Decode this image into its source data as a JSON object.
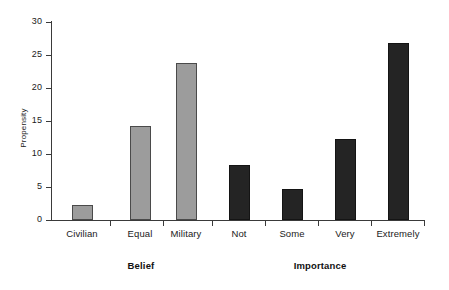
{
  "chart_data": {
    "type": "bar",
    "title": "",
    "subtitle": "",
    "xlabel": "",
    "ylabel": "Propensity",
    "ylim": [
      0,
      30
    ],
    "yticks": [
      0,
      5,
      10,
      15,
      20,
      25,
      30
    ],
    "ytick_labels": [
      "0",
      "5",
      "10",
      "15",
      "20",
      "25",
      "30"
    ],
    "grid": false,
    "legend": null,
    "categories": [
      "Civilian",
      "Equal",
      "Military",
      "Not",
      "Some",
      "Very",
      "Extremely"
    ],
    "values": [
      2.3,
      14.2,
      23.8,
      8.3,
      4.7,
      12.2,
      26.8
    ],
    "bar_colors": [
      "#9c9c9c",
      "#9c9c9c",
      "#9c9c9c",
      "#242424",
      "#242424",
      "#242424",
      "#242424"
    ],
    "groups": [
      {
        "label": "Belief",
        "categories": [
          "Civilian",
          "Equal",
          "Military"
        ],
        "color": "#9c9c9c"
      },
      {
        "label": "Importance",
        "categories": [
          "Not",
          "Some",
          "Very",
          "Extremely"
        ],
        "color": "#242424"
      }
    ],
    "bars": [
      {
        "category": "Civilian",
        "value": 2.3,
        "group": "Belief",
        "color": "#9c9c9c"
      },
      {
        "category": "Equal",
        "value": 14.2,
        "group": "Belief",
        "color": "#9c9c9c"
      },
      {
        "category": "Military",
        "value": 23.8,
        "group": "Belief",
        "color": "#9c9c9c"
      },
      {
        "category": "Not",
        "value": 8.3,
        "group": "Importance",
        "color": "#242424"
      },
      {
        "category": "Some",
        "value": 4.7,
        "group": "Importance",
        "color": "#242424"
      },
      {
        "category": "Very",
        "value": 12.2,
        "group": "Importance",
        "color": "#242424"
      },
      {
        "category": "Extremely",
        "value": 26.8,
        "group": "Importance",
        "color": "#242424"
      }
    ],
    "axis_color": "#3a3a3a"
  }
}
